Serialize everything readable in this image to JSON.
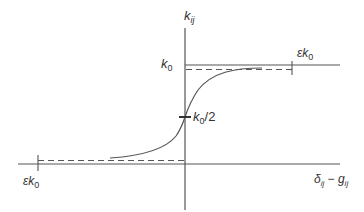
{
  "diagram": {
    "type": "sigmoid-saturation-curve",
    "colors": {
      "line": "#555555",
      "text": "#333333",
      "background": "#ffffff"
    },
    "axes": {
      "y_label": "k_ij",
      "x_label": "δ_ij − g_ij"
    },
    "labels": {
      "upper_level": "k0",
      "midpoint": "k0/2",
      "upper_tolerance": "εk0",
      "lower_tolerance": "εk0"
    },
    "label_parts": {
      "y_main": "k",
      "y_sub": "ij",
      "x_delta": "δ",
      "x_delta_sub": "ij",
      "x_minus": " − ",
      "x_g": "g",
      "x_g_sub": "ij",
      "k": "k",
      "zero": "0",
      "half": "/2",
      "epsilon": "ε"
    }
  }
}
